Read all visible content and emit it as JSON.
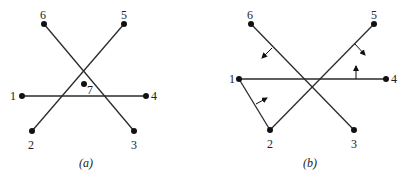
{
  "colors": {
    "line": "#2a2a2a",
    "point": "#111111",
    "text": "#222222",
    "background": "#ffffff"
  },
  "diagrams": [
    {
      "caption": "(a)",
      "points": [
        {
          "label": "1",
          "x": 22,
          "y": 96
        },
        {
          "label": "2",
          "x": 32,
          "y": 131
        },
        {
          "label": "3",
          "x": 134,
          "y": 131
        },
        {
          "label": "4",
          "x": 146,
          "y": 96
        },
        {
          "label": "5",
          "x": 124,
          "y": 24
        },
        {
          "label": "6",
          "x": 44,
          "y": 24
        },
        {
          "label": "7",
          "x": 84,
          "y": 84
        }
      ],
      "segments": [
        [
          "1",
          "4"
        ],
        [
          "2",
          "5"
        ],
        [
          "6",
          "3"
        ]
      ]
    },
    {
      "caption": "(b)",
      "points": [
        {
          "label": "1",
          "x": 239,
          "y": 79
        },
        {
          "label": "2",
          "x": 270,
          "y": 130
        },
        {
          "label": "3",
          "x": 354,
          "y": 130
        },
        {
          "label": "4",
          "x": 386,
          "y": 79
        },
        {
          "label": "5",
          "x": 374,
          "y": 24
        },
        {
          "label": "6",
          "x": 251,
          "y": 24
        }
      ],
      "segments": [
        [
          "1",
          "4"
        ],
        [
          "2",
          "5"
        ],
        [
          "6",
          "3"
        ],
        [
          "1",
          "2"
        ]
      ],
      "normal_arrows": [
        {
          "on_segment": "6-3",
          "direction": "down-left"
        },
        {
          "on_segment": "2-5",
          "direction": "down-right"
        },
        {
          "on_segment": "1-4",
          "direction": "up"
        },
        {
          "on_segment": "1-2",
          "direction": "up-right"
        }
      ]
    }
  ]
}
